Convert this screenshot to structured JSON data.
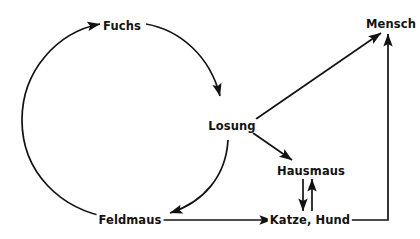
{
  "diagram": {
    "type": "cycle-flow-diagram",
    "background_color": "#ffffff",
    "stroke_color": "#121212",
    "nodes": [
      {
        "id": "fuchs",
        "label": "Fuchs",
        "x": 122,
        "y": 26
      },
      {
        "id": "losung",
        "label": "Losung",
        "x": 232,
        "y": 126
      },
      {
        "id": "mensch",
        "label": "Mensch",
        "x": 391,
        "y": 24
      },
      {
        "id": "hausmaus",
        "label": "Hausmaus",
        "x": 311,
        "y": 171
      },
      {
        "id": "katze-hund",
        "label": "Katze, Hund",
        "x": 310,
        "y": 220
      },
      {
        "id": "feldmaus",
        "label": "Feldmaus",
        "x": 130,
        "y": 220
      }
    ],
    "edges": [
      {
        "id": "feldmaus-to-fuchs",
        "from": "Feldmaus",
        "to": "Fuchs",
        "shape": "arc",
        "arrow": "end"
      },
      {
        "id": "fuchs-to-losung",
        "from": "Fuchs",
        "to": "Losung",
        "shape": "arc",
        "arrow": "end"
      },
      {
        "id": "losung-to-feldmaus",
        "from": "Losung",
        "to": "Feldmaus",
        "shape": "arc",
        "arrow": "end"
      },
      {
        "id": "losung-to-mensch",
        "from": "Losung",
        "to": "Mensch",
        "shape": "line",
        "arrow": "end"
      },
      {
        "id": "losung-to-hausmaus",
        "from": "Losung",
        "to": "Hausmaus",
        "shape": "line",
        "arrow": "end"
      },
      {
        "id": "hausmaus-to-katzehund",
        "from": "Hausmaus",
        "to": "Katze, Hund",
        "shape": "line",
        "arrow": "end"
      },
      {
        "id": "katzehund-to-hausmaus",
        "from": "Katze, Hund",
        "to": "Hausmaus",
        "shape": "line",
        "arrow": "end"
      },
      {
        "id": "feldmaus-to-katzehund",
        "from": "Feldmaus",
        "to": "Katze, Hund",
        "shape": "line",
        "arrow": "end"
      },
      {
        "id": "katzehund-to-mensch",
        "from": "Katze, Hund",
        "to": "Mensch",
        "shape": "elbow",
        "arrow": "end"
      }
    ]
  }
}
